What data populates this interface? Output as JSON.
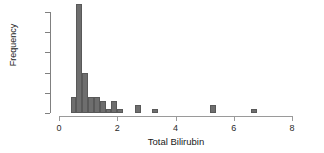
{
  "chart_data": {
    "type": "bar",
    "subtype": "histogram",
    "title": "",
    "xlabel": "Total Bilirubin",
    "ylabel": "Frequency",
    "xlim": [
      0,
      8
    ],
    "ylim": [
      0,
      27
    ],
    "grid": false,
    "legend": null,
    "bin_width": 0.2,
    "bar_color": "#6e6e6e",
    "bar_border_color": "#595959",
    "axis_color": "#9a9a9a",
    "text_color": "#1a1a1a",
    "xticks": [
      0,
      2,
      4,
      6,
      8
    ],
    "xtick_labels": [
      "0",
      "2",
      "4",
      "6",
      "8"
    ],
    "yticks": [
      0,
      5,
      10,
      15,
      20,
      25
    ],
    "ytick_labels": [
      "0",
      "5",
      "10",
      "15",
      "20",
      "25"
    ],
    "bins": [
      {
        "x0": 0.4,
        "x1": 0.6,
        "count": 4
      },
      {
        "x0": 0.6,
        "x1": 0.8,
        "count": 27
      },
      {
        "x0": 0.8,
        "x1": 1.0,
        "count": 10
      },
      {
        "x0": 1.0,
        "x1": 1.2,
        "count": 4
      },
      {
        "x0": 1.2,
        "x1": 1.4,
        "count": 4
      },
      {
        "x0": 1.4,
        "x1": 1.6,
        "count": 3
      },
      {
        "x0": 1.6,
        "x1": 1.8,
        "count": 1
      },
      {
        "x0": 1.8,
        "x1": 2.0,
        "count": 3
      },
      {
        "x0": 2.0,
        "x1": 2.2,
        "count": 1
      },
      {
        "x0": 2.6,
        "x1": 2.8,
        "count": 2
      },
      {
        "x0": 3.2,
        "x1": 3.4,
        "count": 1
      },
      {
        "x0": 5.2,
        "x1": 5.4,
        "count": 2
      },
      {
        "x0": 6.6,
        "x1": 6.8,
        "count": 1
      }
    ],
    "categories": [
      "0.4-0.6",
      "0.6-0.8",
      "0.8-1.0",
      "1.0-1.2",
      "1.2-1.4",
      "1.4-1.6",
      "1.6-1.8",
      "1.8-2.0",
      "2.0-2.2",
      "2.6-2.8",
      "3.2-3.4",
      "5.2-5.4",
      "6.6-6.8"
    ],
    "values": [
      4,
      27,
      10,
      4,
      4,
      3,
      1,
      3,
      1,
      2,
      1,
      2,
      1
    ]
  }
}
